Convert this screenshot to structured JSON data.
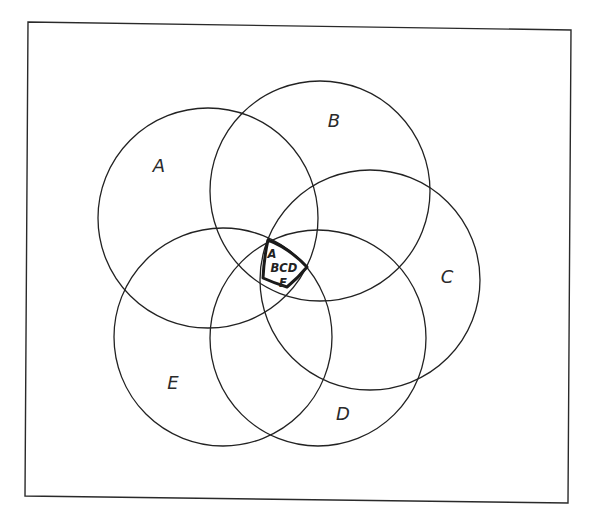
{
  "diagram": {
    "type": "venn",
    "set_count": 5,
    "line_color": "#222222",
    "background": "#ffffff",
    "sets": [
      {
        "id": "A",
        "label": "A",
        "cx": 208,
        "cy": 218,
        "r": 110,
        "label_x": 159,
        "label_y": 172
      },
      {
        "id": "B",
        "label": "B",
        "cx": 320,
        "cy": 191,
        "r": 110,
        "label_x": 334,
        "label_y": 127
      },
      {
        "id": "C",
        "label": "C",
        "cx": 370,
        "cy": 280,
        "r": 110,
        "label_x": 447,
        "label_y": 283
      },
      {
        "id": "D",
        "label": "D",
        "cx": 318,
        "cy": 338,
        "r": 108,
        "label_x": 343,
        "label_y": 420
      },
      {
        "id": "E",
        "label": "E",
        "cx": 223,
        "cy": 337,
        "r": 109,
        "label_x": 173,
        "label_y": 389
      }
    ],
    "core_region": {
      "description": "intersection of all five sets, outlined in bold",
      "lines": [
        "A",
        "BCD",
        "E"
      ],
      "label_positions": [
        {
          "x": 272,
          "y": 258
        },
        {
          "x": 284,
          "y": 272
        },
        {
          "x": 283,
          "y": 287
        }
      ]
    }
  }
}
